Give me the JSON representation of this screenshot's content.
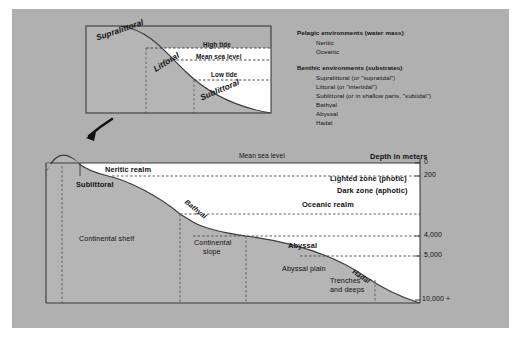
{
  "figure": {
    "title_alt": "Marine environments: pelagic and benthic zones",
    "background_color": "#b0b0b0",
    "water_color": "#ffffff",
    "land_color": "#b0b0b0",
    "line_color": "#333333"
  },
  "inset": {
    "name": "shoreline-tidal-inset",
    "zones": [
      {
        "key": "supralittoral",
        "label": "Supralittoral"
      },
      {
        "key": "littoral",
        "label": "Littoral"
      },
      {
        "key": "sublittoral",
        "label": "Sublittoral"
      }
    ],
    "levels": [
      {
        "key": "high_tide",
        "label": "High tide"
      },
      {
        "key": "mean_sea_level",
        "label": "Mean sea level"
      },
      {
        "key": "low_tide",
        "label": "Low tide"
      }
    ]
  },
  "legend": {
    "groups": [
      {
        "heading": "Pelagic environments (water mass)",
        "items": [
          "Neritic",
          "Oceanic"
        ]
      },
      {
        "heading": "Benthic environments (substrates)",
        "items": [
          "Supralittoral (or \"supratidal\")",
          "Littoral (or \"intertidal\")",
          "Sublittoral (or in shallow parts, \"subtidal\")",
          "Bathyal",
          "Abyssal",
          "Hadal"
        ]
      }
    ]
  },
  "main": {
    "name": "ocean-profile-diagram",
    "sea_level_label": "Mean sea level",
    "depth_axis": {
      "title": "Depth in meters",
      "unit": "meters",
      "ticks": [
        {
          "value": 0,
          "label": "0"
        },
        {
          "value": 200,
          "label": "200"
        },
        {
          "value": 4000,
          "label": "4,000"
        },
        {
          "value": 5000,
          "label": "5,000"
        },
        {
          "value": 10000,
          "label": "10,000 +"
        }
      ]
    },
    "water_zones": [
      {
        "key": "neritic_realm",
        "label": "Neritic realm"
      },
      {
        "key": "oceanic_realm",
        "label": "Oceanic realm"
      },
      {
        "key": "lighted_zone",
        "label": "Lighted zone (photic)"
      },
      {
        "key": "dark_zone",
        "label": "Dark zone (aphotic)"
      }
    ],
    "benthic_zones": [
      {
        "key": "sublittoral",
        "label": "Sublittoral"
      },
      {
        "key": "bathyal",
        "label": "Bathyal"
      },
      {
        "key": "abyssal",
        "label": "Abyssal"
      },
      {
        "key": "hadal",
        "label": "Hadal"
      }
    ],
    "physiographic": [
      {
        "key": "continental_shelf",
        "label": "Continental shelf"
      },
      {
        "key": "continental_slope",
        "label": "Continental",
        "label2": "slope"
      },
      {
        "key": "abyssal_plain",
        "label": "Abyssal plain"
      },
      {
        "key": "trenches",
        "label": "Trenches",
        "label2": "and deeps"
      }
    ]
  }
}
